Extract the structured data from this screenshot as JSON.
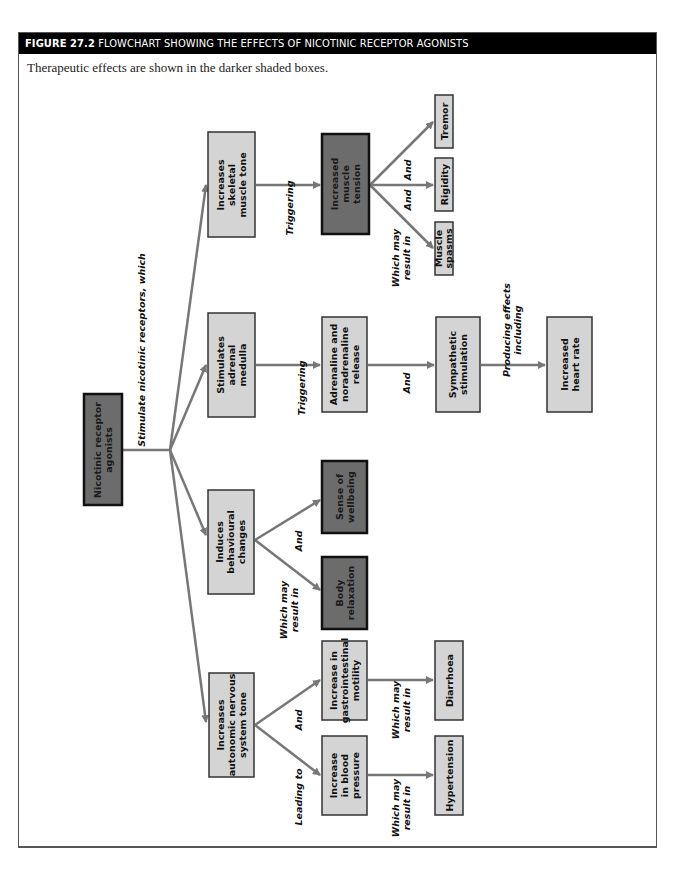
{
  "figure": {
    "number": "FIGURE 27.2",
    "title": "FLOWCHART SHOWING THE EFFECTS OF NICOTINIC RECEPTOR AGONISTS",
    "caption": "Therapeutic effects are shown in the darker shaded boxes."
  },
  "nodes": {
    "root": {
      "lines": [
        "Nicotinic receptor",
        "agonists"
      ],
      "therapeutic": true
    },
    "skeletal": {
      "lines": [
        "Increases",
        "skeletal",
        "muscle tone"
      ],
      "therapeutic": false
    },
    "tension": {
      "lines": [
        "Increased",
        "muscle",
        "tension"
      ],
      "therapeutic": true
    },
    "tremor": {
      "lines": [
        "Tremor"
      ],
      "therapeutic": false
    },
    "rigidity": {
      "lines": [
        "Rigidity"
      ],
      "therapeutic": false
    },
    "spasms": {
      "lines": [
        "Muscle",
        "spasms"
      ],
      "therapeutic": false
    },
    "adrenal": {
      "lines": [
        "Stimulates",
        "adrenal",
        "medulla"
      ],
      "therapeutic": false
    },
    "adrenaline": {
      "lines": [
        "Adrenaline and",
        "noradrenaline",
        "release"
      ],
      "therapeutic": false
    },
    "sympathetic": {
      "lines": [
        "Sympathetic",
        "stimulation"
      ],
      "therapeutic": false
    },
    "heartrate": {
      "lines": [
        "Increased",
        "heart rate"
      ],
      "therapeutic": false
    },
    "behavioural": {
      "lines": [
        "Induces",
        "behavioural",
        "changes"
      ],
      "therapeutic": false
    },
    "wellbeing": {
      "lines": [
        "Sense of",
        "wellbeing"
      ],
      "therapeutic": true
    },
    "relaxation": {
      "lines": [
        "Body",
        "relaxation"
      ],
      "therapeutic": true
    },
    "autonomic": {
      "lines": [
        "Increases",
        "autonomic nervous",
        "system tone"
      ],
      "therapeutic": false
    },
    "gi": {
      "lines": [
        "Increase in",
        "gastrointestinal",
        "motility"
      ],
      "therapeutic": false
    },
    "bp": {
      "lines": [
        "Increase",
        "in blood",
        "pressure"
      ],
      "therapeutic": false
    },
    "diarrhoea": {
      "lines": [
        "Diarrhoea"
      ],
      "therapeutic": false
    },
    "hypertension": {
      "lines": [
        "Hypertension"
      ],
      "therapeutic": false
    }
  },
  "edge_labels": {
    "root_out": [
      "Stimulate nicotinic receptors, which"
    ],
    "skeletal_tension": [
      "Triggering"
    ],
    "tension_tremor": [
      "And"
    ],
    "tension_rigidity": [
      "And"
    ],
    "tension_spasms": [
      "Which may",
      "result in"
    ],
    "adrenal_adrenaline": [
      "Triggering"
    ],
    "adrenaline_sympathetic": [
      "And"
    ],
    "sympathetic_heartrate": [
      "Producing effects",
      "including"
    ],
    "behavioural_wellbeing": [
      "And"
    ],
    "behavioural_relaxation": [
      "Which may",
      "result in"
    ],
    "autonomic_gi": [
      "And"
    ],
    "autonomic_bp": [
      "Leading to"
    ],
    "gi_diarrhoea": [
      "Which may",
      "result in"
    ],
    "bp_hypertension": [
      "Which may",
      "result in"
    ]
  },
  "colors": {
    "light_box": "#d4d4d4",
    "dark_box": "#6c6c6c",
    "arrow": "#777777",
    "title_bar": "#000000"
  }
}
